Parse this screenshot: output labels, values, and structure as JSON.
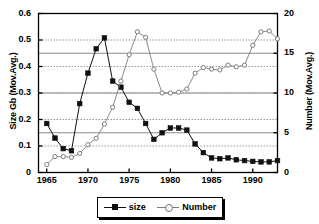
{
  "chart_data": {
    "type": "line",
    "title": "",
    "xlabel": "",
    "ylabel": "Size Gb (Mov.Avg.)",
    "ylabel_right": "Number (Mov.Avg.)",
    "xlim": [
      1964,
      1993
    ],
    "ylim": [
      0,
      0.6
    ],
    "ylim_right": [
      0,
      20
    ],
    "xticks": [
      1965,
      1970,
      1975,
      1980,
      1985,
      1990
    ],
    "yticks": [
      0,
      0.1,
      0.2,
      0.3,
      0.4,
      0.5,
      0.6
    ],
    "yticks_right": [
      0,
      5,
      10,
      15,
      20
    ],
    "grid": "horizontal dotted at left-axis ticks plus solid gridlines at right-axis ticks",
    "legend_position": "below axes, centered",
    "x": [
      1965,
      1966,
      1967,
      1968,
      1969,
      1970,
      1971,
      1972,
      1973,
      1974,
      1975,
      1976,
      1977,
      1978,
      1979,
      1980,
      1981,
      1982,
      1983,
      1984,
      1985,
      1986,
      1987,
      1988,
      1989,
      1990,
      1991,
      1992,
      1993
    ],
    "series": [
      {
        "name": "size",
        "axis": "left",
        "marker": "filled-square",
        "color": "#101010",
        "values": [
          0.185,
          0.13,
          0.09,
          0.082,
          0.26,
          0.375,
          0.467,
          0.508,
          0.345,
          0.322,
          0.265,
          0.242,
          0.185,
          0.125,
          0.15,
          0.168,
          0.168,
          0.16,
          0.108,
          0.075,
          0.055,
          0.052,
          0.055,
          0.048,
          0.045,
          0.042,
          0.04,
          0.04,
          0.045
        ]
      },
      {
        "name": "Number",
        "axis": "right",
        "marker": "open-circle",
        "color": "#7d7d7d",
        "values": [
          1.0,
          2.0,
          2.0,
          1.9,
          2.4,
          3.5,
          4.3,
          6.1,
          8.2,
          11.5,
          14.8,
          17.7,
          17.0,
          13.0,
          10.0,
          10.0,
          10.1,
          10.5,
          12.5,
          13.2,
          13.0,
          12.9,
          13.5,
          13.3,
          13.5,
          16.0,
          17.7,
          17.8,
          16.8
        ]
      }
    ]
  },
  "axes": {
    "left_title": "Size Gb (Mov.Avg.)",
    "right_title": "Number (Mov.Avg.)",
    "left_ticks": [
      "0.6",
      "0.5",
      "0.4",
      "0.3",
      "0.2",
      "0.1",
      "0"
    ],
    "right_ticks": [
      "20",
      "15",
      "10",
      "5",
      "0"
    ],
    "x_ticks": [
      "1965",
      "1970",
      "1975",
      "1980",
      "1985",
      "1990"
    ]
  },
  "legend": {
    "items": [
      {
        "label": "size",
        "marker": "filled-square",
        "color": "#101010"
      },
      {
        "label": "Number",
        "marker": "open-circle",
        "color": "#7d7d7d"
      }
    ]
  }
}
